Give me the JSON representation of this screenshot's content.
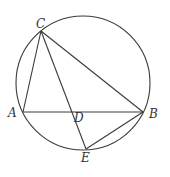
{
  "diagram": {
    "type": "geometry",
    "circle": {
      "cx": 83,
      "cy": 83,
      "r": 67
    },
    "points": {
      "A": {
        "x": 23,
        "y": 112,
        "label": "A",
        "lx": 8,
        "ly": 117
      },
      "B": {
        "x": 143,
        "y": 112,
        "label": "B",
        "lx": 149,
        "ly": 118
      },
      "C": {
        "x": 41,
        "y": 31,
        "label": "C",
        "lx": 36,
        "ly": 28
      },
      "D": {
        "x": 73,
        "y": 112,
        "label": "D",
        "lx": 74,
        "ly": 122
      },
      "E": {
        "x": 86,
        "y": 149,
        "label": "E",
        "lx": 81,
        "ly": 162
      }
    },
    "segments": [
      [
        "A",
        "B"
      ],
      [
        "A",
        "C"
      ],
      [
        "C",
        "B"
      ],
      [
        "C",
        "E"
      ],
      [
        "E",
        "B"
      ]
    ],
    "stroke_color": "#3a3a3a"
  }
}
